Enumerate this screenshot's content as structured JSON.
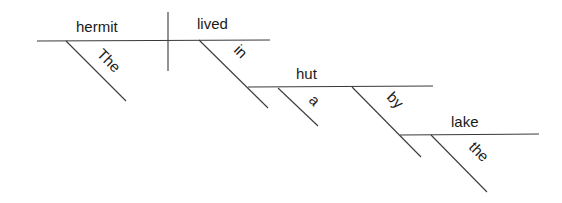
{
  "diagram": {
    "type": "sentence-diagram (Reed-Kellogg)",
    "sentence_words": [
      "The",
      "hermit",
      "lived",
      "in",
      "a",
      "hut",
      "by",
      "the",
      "lake"
    ],
    "subject": "hermit",
    "verb": "lived",
    "subject_modifiers": [
      "The"
    ],
    "prepositions": [
      {
        "word": "in",
        "object": "hut",
        "object_modifiers": [
          "a"
        ]
      },
      {
        "word": "by",
        "object": "lake",
        "object_modifiers": [
          "the"
        ]
      }
    ]
  },
  "labels": {
    "subject": "hermit",
    "verb": "lived",
    "article_the_cap": "The",
    "prep_in": "in",
    "obj_hut": "hut",
    "article_a": "a",
    "prep_by": "by",
    "obj_lake": "lake",
    "article_the": "the"
  },
  "colors": {
    "line": "#3a3a3a",
    "text": "#1a1a1a",
    "background": "#ffffff"
  }
}
